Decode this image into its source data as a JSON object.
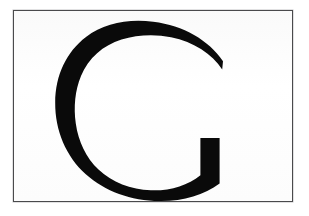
{
  "image": {
    "kind": "letter-card",
    "width": 309,
    "height": 216,
    "background_color": "#ffffff",
    "description": "Printed card showing a single large uppercase letter"
  },
  "card": {
    "frame_color": "#4a4a4c",
    "face_color": "#fdfdfd",
    "frame_left": 13,
    "frame_top": 10,
    "frame_width": 280,
    "frame_height": 192
  },
  "glyph": {
    "character": "G",
    "case": "uppercase",
    "color": "#0a0a0a",
    "style": "geometric sans-serif, no crossbar",
    "bounds": {
      "left": 78,
      "top": 21,
      "right": 222,
      "bottom": 187
    }
  },
  "labels": {
    "caption": "G"
  }
}
